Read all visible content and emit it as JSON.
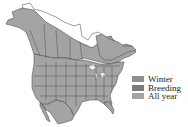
{
  "map": {
    "title": "",
    "region": "North America",
    "colors": {
      "all_year": "#a4a4a4",
      "winter": "#8f8f8f",
      "breeding": "#7b7b7b",
      "no_range": "#ffffff",
      "border": "#3c3c3c"
    },
    "range_fill": "all_year"
  },
  "legend": {
    "items": [
      {
        "key": "winter",
        "label": "Winter",
        "color": "#8f8f8f"
      },
      {
        "key": "breeding",
        "label": "Breeding",
        "color": "#7b7b7b"
      },
      {
        "key": "all_year",
        "label": "All year",
        "color": "#a4a4a4"
      }
    ]
  }
}
